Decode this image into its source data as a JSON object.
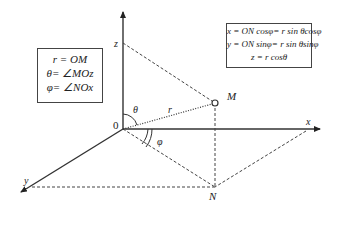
{
  "diagram": {
    "axes": {
      "x": "x",
      "y": "y",
      "z": "z",
      "origin": "0"
    },
    "points": {
      "M": "M",
      "N": "N"
    },
    "labels": {
      "r": "r",
      "theta": "θ",
      "phi": "φ"
    },
    "definitions_box": [
      "r = OM",
      "θ= ∠MOz",
      "φ= ∠NOx"
    ],
    "formulas_box": [
      "x = ON cosφ= r sin θcosφ",
      "y = ON sinφ= r sin θsinφ",
      "z =  r cosθ"
    ]
  }
}
